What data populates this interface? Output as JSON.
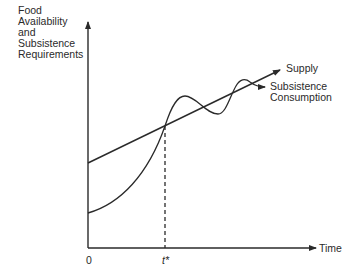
{
  "diagram": {
    "y_axis_label": [
      "Food",
      "Availability",
      "and",
      "Subsistence",
      "Requirements"
    ],
    "x_axis_label": "Time",
    "origin_label": "0",
    "tick_label": "t*",
    "series": [
      {
        "name": "Supply",
        "shape": "straight rising line with arrow"
      },
      {
        "name": "Subsistence Consumption",
        "shape": "convex rising curve crossing supply at t*, then damped oscillation around supply line with arrow"
      }
    ],
    "annotations": {
      "supply_label": "Supply",
      "subsistence_label": [
        "Subsistence",
        "Consumption"
      ],
      "crossing_marker": "dashed vertical line from crossing point down to t*"
    },
    "colors": {
      "line": "#2a2a2a",
      "background": "#ffffff"
    }
  }
}
